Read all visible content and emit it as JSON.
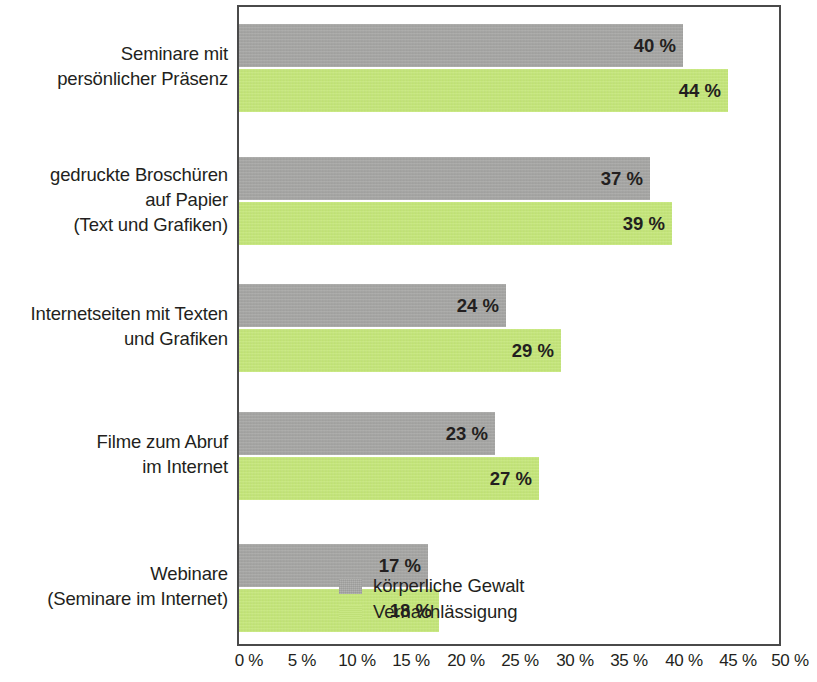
{
  "chart_data": {
    "type": "bar",
    "orientation": "horizontal",
    "title": "",
    "subtitle": "",
    "xlabel": "",
    "ylabel": "",
    "xlim": [
      0,
      50
    ],
    "grid": false,
    "legend_position": "inside-bottom-right",
    "value_suffix": " %",
    "categories": [
      "Seminare mit\npersönlicher Präsenz",
      "gedruckte Broschüren\nauf Papier\n(Text und Grafiken)",
      "Internetseiten mit Texten\nund Grafiken",
      "Filme zum Abruf\nim Internet",
      "Webinare\n(Seminare im Internet)"
    ],
    "series": [
      {
        "name": "körperliche Gewalt",
        "color": "#a9a9a7",
        "values": [
          40,
          37,
          24,
          23,
          17
        ],
        "value_labels": [
          "40 %",
          "37 %",
          "24 %",
          "23 %",
          "17 %"
        ]
      },
      {
        "name": "Vernachlässigung",
        "color": "#c5e877",
        "values": [
          44,
          39,
          29,
          27,
          18
        ],
        "value_labels": [
          "44 %",
          "39 %",
          "29 %",
          "27 %",
          "18 %"
        ]
      }
    ],
    "xticks": [
      0,
      5,
      10,
      15,
      20,
      25,
      30,
      35,
      40,
      45,
      50
    ],
    "xtick_labels": [
      "0 %",
      "5 %",
      "10 %",
      "15 %",
      "20 %",
      "25 %",
      "30 %",
      "35 %",
      "40 %",
      "45 %",
      "50 %"
    ]
  },
  "legend": {
    "items": [
      {
        "label": "körperliche Gewalt",
        "color": "#a9a9a7"
      },
      {
        "label": "Vernachlässigung",
        "color": "#c5e877"
      }
    ]
  },
  "axis": {
    "x_labels": [
      "0 %",
      "5 %",
      "10 %",
      "15 %",
      "20 %",
      "25 %",
      "30 %",
      "35 %",
      "40 %",
      "45 %",
      "50 %"
    ]
  },
  "categories": [
    {
      "label": "Seminare mit\npersönlicher Präsenz"
    },
    {
      "label": "gedruckte Broschüren\nauf Papier\n(Text und Grafiken)"
    },
    {
      "label": "Internetseiten mit Texten\nund Grafiken"
    },
    {
      "label": "Filme zum Abruf\nim Internet"
    },
    {
      "label": "Webinare\n(Seminare im Internet)"
    }
  ],
  "bars": {
    "g0s0": "40 %",
    "g0s1": "44 %",
    "g1s0": "37 %",
    "g1s1": "39 %",
    "g2s0": "24 %",
    "g2s1": "29 %",
    "g3s0": "23 %",
    "g3s1": "27 %",
    "g4s0": "17 %",
    "g4s1": "18 %"
  }
}
